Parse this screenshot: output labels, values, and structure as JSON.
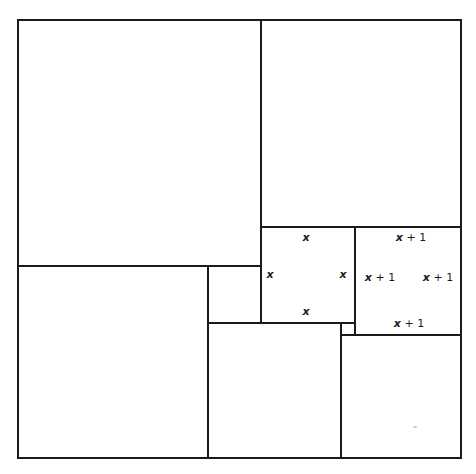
{
  "diagram": {
    "type": "squared-square-dissection",
    "line_color": "#1a1a1a",
    "background": "#ffffff",
    "squares": [
      {
        "id": "outer",
        "x": 17,
        "y": 19,
        "w": 445,
        "h": 440
      },
      {
        "id": "top-left",
        "x": 17,
        "y": 19,
        "w": 245,
        "h": 248
      },
      {
        "id": "top-right",
        "x": 260,
        "y": 19,
        "w": 202,
        "h": 209
      },
      {
        "id": "bottom-left",
        "x": 17,
        "y": 265,
        "w": 192,
        "h": 194
      },
      {
        "id": "small-mid",
        "x": 207,
        "y": 265,
        "w": 55,
        "h": 59
      },
      {
        "id": "square-x",
        "x": 260,
        "y": 226,
        "w": 96,
        "h": 98
      },
      {
        "id": "square-x1",
        "x": 354,
        "y": 226,
        "w": 108,
        "h": 110
      },
      {
        "id": "bottom-mid",
        "x": 207,
        "y": 322,
        "w": 135,
        "h": 137
      },
      {
        "id": "tiny",
        "x": 340,
        "y": 322,
        "w": 16,
        "h": 14
      },
      {
        "id": "bottom-right",
        "x": 340,
        "y": 334,
        "w": 122,
        "h": 125
      }
    ],
    "labels": {
      "square_x": {
        "top": {
          "var": "x",
          "rest": ""
        },
        "left": {
          "var": "x",
          "rest": ""
        },
        "right": {
          "var": "x",
          "rest": ""
        },
        "bottom": {
          "var": "x",
          "rest": ""
        }
      },
      "square_x1": {
        "top": {
          "var": "x",
          "rest": " + 1"
        },
        "left": {
          "var": "x",
          "rest": " + 1"
        },
        "right": {
          "var": "x",
          "rest": " + 1"
        },
        "bottom": {
          "var": "x",
          "rest": " + 1"
        }
      }
    }
  }
}
